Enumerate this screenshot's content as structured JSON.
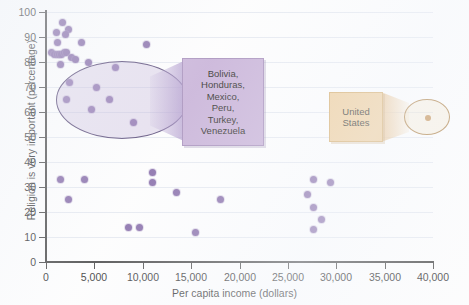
{
  "chart": {
    "type": "scatter",
    "title": "",
    "xlabel": "Per capita income (dollars)",
    "ylabel": "Religion is very important (percentage)",
    "xlim": [
      0,
      40000
    ],
    "ylim": [
      0,
      100
    ],
    "xticks": [
      "0",
      "5,000",
      "10,000",
      "15,000",
      "20,000",
      "25,000",
      "30,000",
      "35,000",
      "40,000"
    ],
    "xtick_values": [
      0,
      5000,
      10000,
      15000,
      20000,
      25000,
      30000,
      35000,
      40000
    ],
    "yticks": [
      "0",
      "10",
      "20",
      "30",
      "40",
      "50",
      "60",
      "70",
      "80",
      "90",
      "100"
    ],
    "ytick_values": [
      0,
      10,
      20,
      30,
      40,
      50,
      60,
      70,
      80,
      90,
      100
    ],
    "grid": true,
    "legend": "none",
    "point_color": "#7b5ea0",
    "highlight_color": "#c3abd4",
    "us_color": "#edc993"
  },
  "chart_data": {
    "type": "scatter",
    "title": "",
    "xlabel": "Per capita income (dollars)",
    "ylabel": "Religion is very important (percentage)",
    "xlim": [
      0,
      40000
    ],
    "ylim": [
      0,
      100
    ],
    "grid": true,
    "legend": "none",
    "series": [
      {
        "name": "Countries",
        "points": [
          {
            "x": 1700,
            "y": 96
          },
          {
            "x": 1100,
            "y": 92
          },
          {
            "x": 2300,
            "y": 93
          },
          {
            "x": 2000,
            "y": 91
          },
          {
            "x": 1200,
            "y": 88
          },
          {
            "x": 3700,
            "y": 88
          },
          {
            "x": 600,
            "y": 84
          },
          {
            "x": 900,
            "y": 83
          },
          {
            "x": 1150,
            "y": 83
          },
          {
            "x": 1400,
            "y": 83
          },
          {
            "x": 1650,
            "y": 83
          },
          {
            "x": 1900,
            "y": 84
          },
          {
            "x": 2150,
            "y": 84
          },
          {
            "x": 2600,
            "y": 82
          },
          {
            "x": 3100,
            "y": 81
          },
          {
            "x": 4400,
            "y": 80
          },
          {
            "x": 1500,
            "y": 79
          },
          {
            "x": 10400,
            "y": 87
          },
          {
            "x": 7200,
            "y": 78
          },
          {
            "x": 2400,
            "y": 72
          },
          {
            "x": 5200,
            "y": 70
          },
          {
            "x": 2100,
            "y": 65
          },
          {
            "x": 6600,
            "y": 65
          },
          {
            "x": 4700,
            "y": 61
          },
          {
            "x": 9000,
            "y": 56
          },
          {
            "x": 1500,
            "y": 33
          },
          {
            "x": 4000,
            "y": 33
          },
          {
            "x": 2300,
            "y": 25
          },
          {
            "x": 11000,
            "y": 36
          },
          {
            "x": 11000,
            "y": 32
          },
          {
            "x": 13500,
            "y": 28
          },
          {
            "x": 18000,
            "y": 25
          },
          {
            "x": 8500,
            "y": 14
          },
          {
            "x": 9700,
            "y": 14
          },
          {
            "x": 15500,
            "y": 12
          },
          {
            "x": 27700,
            "y": 33
          },
          {
            "x": 29400,
            "y": 32
          },
          {
            "x": 27000,
            "y": 27
          },
          {
            "x": 27700,
            "y": 22
          },
          {
            "x": 28500,
            "y": 17
          },
          {
            "x": 27700,
            "y": 13
          }
        ]
      },
      {
        "name": "United States",
        "points": [
          {
            "x": 37000,
            "y": 60
          }
        ]
      }
    ],
    "annotations": [
      {
        "name": "developing-country-cluster",
        "label": "Bolivia,\nHonduras,\nMexico,\nPeru,\nTurkey,\nVenezuela",
        "shape": "ellipse",
        "color": "#c3abd4"
      },
      {
        "name": "united-states",
        "label": "United\nStates",
        "shape": "ellipse",
        "color": "#edc993"
      }
    ]
  },
  "callouts": {
    "cluster": {
      "label": "Bolivia,\nHonduras,\nMexico,\nPeru,\nTurkey,\nVenezuela"
    },
    "united_states": {
      "label": "United\nStates"
    }
  }
}
